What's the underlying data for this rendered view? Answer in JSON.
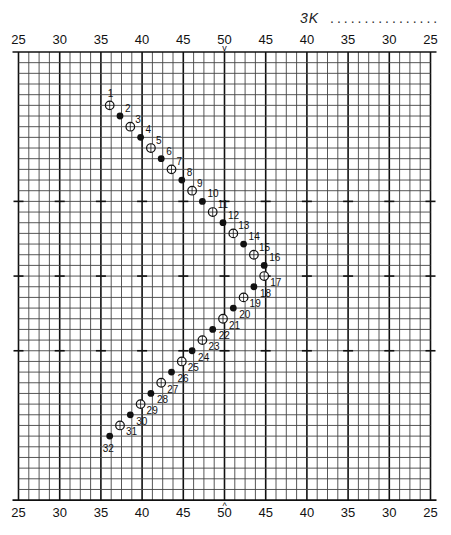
{
  "header": {
    "label": "3K",
    "fill_line": "................"
  },
  "axis": {
    "top_labels": [
      "25",
      "30",
      "35",
      "40",
      "45",
      "50",
      "45",
      "40",
      "35",
      "30",
      "25"
    ],
    "bottom_labels": [
      "25",
      "30",
      "35",
      "40",
      "45",
      "50",
      "45",
      "40",
      "35",
      "30",
      "25"
    ],
    "center_marker_top": "v",
    "center_marker_bottom": "^"
  },
  "grid": {
    "columns": 40,
    "rows": 42,
    "major_every_columns": 4,
    "row_ticks": [
      14,
      21,
      28
    ]
  },
  "colors": {
    "ink": "#111111",
    "grid_minor": "#444444",
    "grid_major": "#111111",
    "background": "#ffffff"
  },
  "chart_data": {
    "type": "scatter",
    "title": "3K",
    "x_scale_labels": [
      "25",
      "30",
      "35",
      "40",
      "45",
      "50",
      "45",
      "40",
      "35",
      "30",
      "25"
    ],
    "legend": [
      {
        "marker": "open-circle",
        "applies_to": "odd numbers"
      },
      {
        "marker": "filled-dot",
        "applies_to": "even numbers"
      }
    ],
    "points": [
      {
        "n": 1,
        "col": 9,
        "row": 5,
        "type": "open"
      },
      {
        "n": 2,
        "col": 10,
        "row": 6,
        "type": "filled"
      },
      {
        "n": 3,
        "col": 11,
        "row": 7,
        "type": "open"
      },
      {
        "n": 4,
        "col": 12,
        "row": 8,
        "type": "filled"
      },
      {
        "n": 5,
        "col": 13,
        "row": 9,
        "type": "open"
      },
      {
        "n": 6,
        "col": 14,
        "row": 10,
        "type": "filled"
      },
      {
        "n": 7,
        "col": 15,
        "row": 11,
        "type": "open"
      },
      {
        "n": 8,
        "col": 16,
        "row": 12,
        "type": "filled"
      },
      {
        "n": 9,
        "col": 17,
        "row": 13,
        "type": "open"
      },
      {
        "n": 10,
        "col": 18,
        "row": 14,
        "type": "filled"
      },
      {
        "n": 11,
        "col": 19,
        "row": 15,
        "type": "open"
      },
      {
        "n": 12,
        "col": 20,
        "row": 16,
        "type": "filled"
      },
      {
        "n": 13,
        "col": 21,
        "row": 17,
        "type": "open"
      },
      {
        "n": 14,
        "col": 22,
        "row": 18,
        "type": "filled"
      },
      {
        "n": 15,
        "col": 23,
        "row": 19,
        "type": "open"
      },
      {
        "n": 16,
        "col": 24,
        "row": 20,
        "type": "filled"
      },
      {
        "n": 17,
        "col": 24,
        "row": 21,
        "type": "open"
      },
      {
        "n": 18,
        "col": 23,
        "row": 22,
        "type": "filled"
      },
      {
        "n": 19,
        "col": 22,
        "row": 23,
        "type": "open"
      },
      {
        "n": 20,
        "col": 21,
        "row": 24,
        "type": "filled"
      },
      {
        "n": 21,
        "col": 20,
        "row": 25,
        "type": "open"
      },
      {
        "n": 22,
        "col": 19,
        "row": 26,
        "type": "filled"
      },
      {
        "n": 23,
        "col": 18,
        "row": 27,
        "type": "open"
      },
      {
        "n": 24,
        "col": 17,
        "row": 28,
        "type": "filled"
      },
      {
        "n": 25,
        "col": 16,
        "row": 29,
        "type": "open"
      },
      {
        "n": 26,
        "col": 15,
        "row": 30,
        "type": "filled"
      },
      {
        "n": 27,
        "col": 14,
        "row": 31,
        "type": "open"
      },
      {
        "n": 28,
        "col": 13,
        "row": 32,
        "type": "filled"
      },
      {
        "n": 29,
        "col": 12,
        "row": 33,
        "type": "open"
      },
      {
        "n": 30,
        "col": 11,
        "row": 34,
        "type": "filled"
      },
      {
        "n": 31,
        "col": 10,
        "row": 35,
        "type": "open"
      },
      {
        "n": 32,
        "col": 9,
        "row": 36,
        "type": "filled"
      }
    ]
  }
}
